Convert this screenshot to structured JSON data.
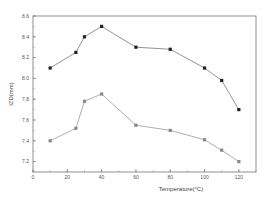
{
  "chart_data": {
    "type": "line",
    "title": "",
    "xlabel": "Temperature(°C)",
    "ylabel": "IZD(mm)",
    "xlim": [
      0,
      130
    ],
    "ylim": [
      7.1,
      8.6
    ],
    "xticks": [
      0,
      20,
      40,
      60,
      80,
      100,
      120
    ],
    "yticks": [
      7.2,
      7.4,
      7.6,
      7.8,
      8.0,
      8.2,
      8.4,
      8.6
    ],
    "xtick_labels": [
      "0",
      "20",
      "40",
      "60",
      "80",
      "100",
      "120"
    ],
    "ytick_labels": [
      "7.2",
      "7.4",
      "7.6",
      "7.8",
      "8.0",
      "8.2",
      "8.4",
      "8.6"
    ],
    "grid": false,
    "legend": null,
    "series": [
      {
        "name": "series-1",
        "color": "#222222",
        "line_color": "#777777",
        "marker": "square",
        "x": [
          10,
          25,
          30,
          40,
          60,
          80,
          100,
          110,
          120
        ],
        "values": [
          8.1,
          8.25,
          8.4,
          8.5,
          8.3,
          8.28,
          8.1,
          7.98,
          7.7
        ]
      },
      {
        "name": "series-2",
        "color": "#888888",
        "line_color": "#999999",
        "marker": "square",
        "x": [
          10,
          25,
          30,
          40,
          60,
          80,
          100,
          110,
          120
        ],
        "values": [
          7.4,
          7.52,
          7.78,
          7.85,
          7.55,
          7.5,
          7.41,
          7.31,
          7.2
        ]
      }
    ]
  }
}
